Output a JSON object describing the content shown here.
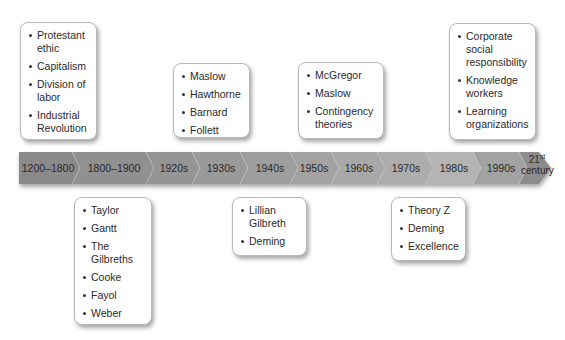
{
  "timeline": {
    "segments": [
      {
        "label": "1200–1800",
        "fill": "#8a8a8a"
      },
      {
        "label": "1800–1900",
        "fill": "#909090"
      },
      {
        "label": "1920s",
        "fill": "#959595"
      },
      {
        "label": "1930s",
        "fill": "#9a9a9a"
      },
      {
        "label": "1940s",
        "fill": "#9e9e9e"
      },
      {
        "label": "1950s",
        "fill": "#a3a3a3"
      },
      {
        "label": "1960s",
        "fill": "#a8a8a8"
      },
      {
        "label": "1970s",
        "fill": "#adadad"
      },
      {
        "label": "1980s",
        "fill": "#b4b4b4"
      },
      {
        "label": "1990s",
        "fill": "#a2a2a2"
      },
      {
        "label_num": "21",
        "label_sup": "st",
        "label_word": "century",
        "fill": "#8c8c8c"
      }
    ]
  },
  "boxes": {
    "b1200_1800": {
      "items": [
        "Protestant ethic",
        "Capitalism",
        "Division of labor",
        "Industrial Revolution"
      ]
    },
    "b1800_1900": {
      "items": [
        "Taylor",
        "Gantt",
        "The Gilbreths",
        "Cooke",
        "Fayol",
        "Weber"
      ]
    },
    "b1920s_1930s": {
      "items": [
        "Maslow",
        "Hawthorne",
        "Barnard",
        "Follett"
      ]
    },
    "b1940s_1950s": {
      "items": [
        "Lillian Gilbreth",
        "Deming"
      ]
    },
    "b1950s_1960s": {
      "items": [
        "McGregor",
        "Maslow",
        "Contingency theories"
      ]
    },
    "b1980s": {
      "items": [
        "Theory Z",
        "Deming",
        "Excellence"
      ]
    },
    "b21st": {
      "items": [
        "Corporate social responsibility",
        "Knowledge workers",
        "Learning organizations"
      ]
    }
  }
}
